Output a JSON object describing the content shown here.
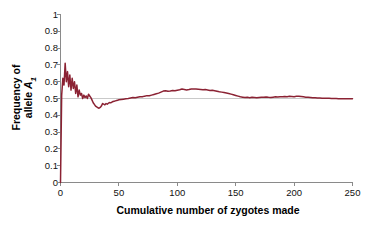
{
  "chart_data": {
    "type": "line",
    "title": "",
    "xlabel": "Cumulative number of zygotes made",
    "ylabel_line1": "Frequency of",
    "ylabel_line2_prefix": "allele ",
    "ylabel_line2_symbol": "A",
    "ylabel_line2_sub": "1",
    "ylabel_plain": "Frequency of allele A1",
    "xlim": [
      0,
      250
    ],
    "ylim": [
      0,
      1
    ],
    "xticks": [
      0,
      50,
      100,
      150,
      200,
      250
    ],
    "yticks": [
      0,
      0.1,
      0.2,
      0.3,
      0.4,
      0.5,
      0.6,
      0.7,
      0.8,
      0.9,
      1
    ],
    "xtick_labels": [
      "0",
      "50",
      "100",
      "150",
      "200",
      "250"
    ],
    "ytick_labels": [
      "0",
      "0.1",
      "0.2",
      "0.3",
      "0.4",
      "0.5",
      "0.6",
      "0.7",
      "0.8",
      "0.9",
      "1"
    ],
    "grid": false,
    "legend": "none",
    "line_color": "#8b2233",
    "reference_line": {
      "orientation": "horizontal",
      "value": 0.5,
      "color": "#c9c9c9"
    },
    "series": [
      {
        "name": "Frequency of allele A1",
        "x": [
          0,
          1,
          2,
          3,
          4,
          5,
          6,
          7,
          8,
          9,
          10,
          11,
          12,
          13,
          14,
          15,
          16,
          17,
          18,
          19,
          20,
          21,
          22,
          23,
          24,
          25,
          26,
          27,
          28,
          29,
          30,
          31,
          32,
          33,
          34,
          35,
          36,
          37,
          38,
          39,
          40,
          41,
          42,
          43,
          44,
          45,
          46,
          47,
          48,
          49,
          50,
          52,
          54,
          56,
          58,
          60,
          62,
          64,
          66,
          68,
          70,
          72,
          74,
          76,
          78,
          80,
          82,
          84,
          86,
          88,
          90,
          92,
          94,
          96,
          98,
          100,
          102,
          104,
          106,
          108,
          110,
          112,
          114,
          116,
          118,
          120,
          122,
          124,
          126,
          128,
          130,
          132,
          134,
          136,
          138,
          140,
          142,
          144,
          146,
          148,
          150,
          152,
          154,
          156,
          158,
          160,
          162,
          164,
          166,
          168,
          170,
          172,
          174,
          176,
          178,
          180,
          182,
          184,
          186,
          188,
          190,
          192,
          194,
          196,
          198,
          200,
          202,
          204,
          206,
          208,
          210,
          212,
          214,
          216,
          218,
          220,
          222,
          224,
          226,
          228,
          230,
          232,
          234,
          236,
          238,
          240,
          242,
          244,
          246,
          248,
          250
        ],
        "y": [
          0.0,
          0.52,
          0.62,
          0.58,
          0.71,
          0.6,
          0.66,
          0.57,
          0.64,
          0.55,
          0.62,
          0.56,
          0.6,
          0.53,
          0.58,
          0.51,
          0.55,
          0.52,
          0.53,
          0.5,
          0.52,
          0.505,
          0.515,
          0.5,
          0.525,
          0.515,
          0.505,
          0.49,
          0.475,
          0.465,
          0.455,
          0.45,
          0.445,
          0.442,
          0.447,
          0.455,
          0.47,
          0.466,
          0.462,
          0.47,
          0.466,
          0.472,
          0.476,
          0.474,
          0.478,
          0.482,
          0.484,
          0.486,
          0.488,
          0.49,
          0.492,
          0.494,
          0.496,
          0.498,
          0.5,
          0.503,
          0.506,
          0.504,
          0.508,
          0.511,
          0.51,
          0.514,
          0.517,
          0.516,
          0.52,
          0.524,
          0.528,
          0.532,
          0.538,
          0.544,
          0.546,
          0.543,
          0.545,
          0.548,
          0.546,
          0.549,
          0.552,
          0.556,
          0.554,
          0.551,
          0.553,
          0.556,
          0.557,
          0.556,
          0.555,
          0.554,
          0.552,
          0.553,
          0.551,
          0.548,
          0.549,
          0.546,
          0.543,
          0.54,
          0.538,
          0.536,
          0.533,
          0.53,
          0.526,
          0.522,
          0.518,
          0.514,
          0.51,
          0.508,
          0.506,
          0.507,
          0.505,
          0.508,
          0.506,
          0.504,
          0.506,
          0.508,
          0.507,
          0.509,
          0.507,
          0.506,
          0.508,
          0.51,
          0.509,
          0.511,
          0.51,
          0.512,
          0.511,
          0.513,
          0.512,
          0.511,
          0.513,
          0.514,
          0.512,
          0.51,
          0.508,
          0.507,
          0.506,
          0.505,
          0.504,
          0.503,
          0.503,
          0.502,
          0.502,
          0.501,
          0.501,
          0.5,
          0.5,
          0.5,
          0.499,
          0.499,
          0.499,
          0.498,
          0.498,
          0.498,
          0.498
        ]
      }
    ]
  }
}
